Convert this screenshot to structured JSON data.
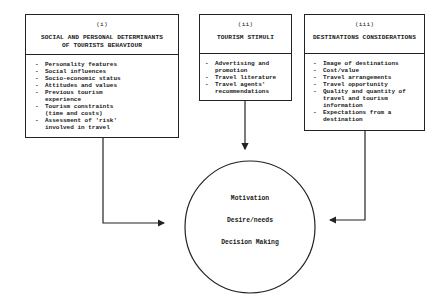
{
  "boxes": [
    {
      "number": "(i)",
      "title_line1": "SOCIAL AND PERSONAL DETERMINANTS",
      "title_line2": "OF TOURISTS BEHAVIOUR",
      "items": [
        "Personality features",
        "Social influences",
        "Socio-economic status",
        "Attitudes and values",
        "Previous tourism experience",
        "Tourism constraints (time and costs)",
        "Assessment of 'risk' involved in travel"
      ]
    },
    {
      "number": "(ii)",
      "title_line1": "TOURISM STIMULI",
      "title_line2": "",
      "items": [
        "Advertising and promotion",
        "Travel literature",
        "Travel agents' recommendations"
      ]
    },
    {
      "number": "(iii)",
      "title_line1": "DESTINATIONS CONSIDERATIONS",
      "title_line2": "",
      "items": [
        "Image of destinations",
        "Cost/value",
        "Travel arrangements",
        "Travel opportunity",
        "Quality and quantity of travel and tourism information",
        "Expectations from a destination"
      ]
    }
  ],
  "center": {
    "lines": [
      "Motivation",
      "Desire/needs",
      "Decision Making"
    ]
  },
  "colors": {
    "line": "#222222",
    "background": "#ffffff"
  },
  "bullet": "-"
}
